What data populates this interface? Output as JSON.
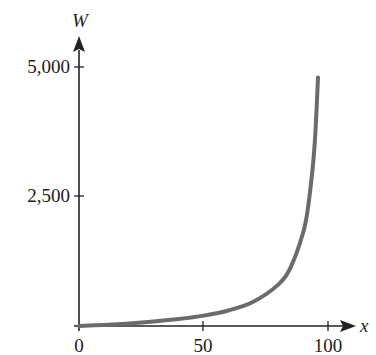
{
  "chart_data": {
    "type": "line",
    "title": "",
    "xlabel": "x",
    "ylabel": "W",
    "xlim": [
      0,
      100
    ],
    "ylim": [
      0,
      5000
    ],
    "grid": false,
    "legend": null,
    "x_ticks": [
      0,
      50,
      100
    ],
    "x_tick_labels": [
      "0",
      "50",
      "100"
    ],
    "y_ticks": [
      2500,
      5000
    ],
    "y_tick_labels": [
      "2,500",
      "5,000"
    ],
    "series": [
      {
        "name": "W",
        "color": "#6b6b6b",
        "x": [
          0,
          10,
          20,
          30,
          40,
          50,
          60,
          70,
          80,
          85,
          90,
          92,
          94,
          95,
          96
        ],
        "values": [
          0,
          22,
          50,
          86,
          133,
          200,
          300,
          467,
          800,
          1133,
          1800,
          2300,
          3133,
          3800,
          4800
        ]
      }
    ]
  }
}
